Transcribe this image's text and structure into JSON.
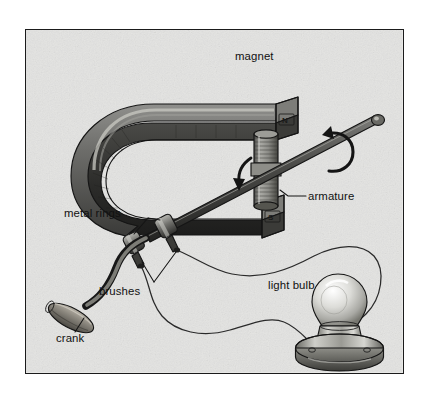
{
  "figure": {
    "frame": {
      "border_color": "#1b1b1b",
      "background_color": "#e8e8e6",
      "outer_background": "#ffffff"
    },
    "labels": [
      {
        "id": "magnet",
        "text": "magnet",
        "x": 234,
        "y": 55
      },
      {
        "id": "armature",
        "text": "armature",
        "x": 286,
        "y": 175
      },
      {
        "id": "metal-rings",
        "text": "metal rings",
        "x": 63,
        "y": 192
      },
      {
        "id": "brushes",
        "text": "brushes",
        "x": 98,
        "y": 261
      },
      {
        "id": "crank",
        "text": "crank",
        "x": 55,
        "y": 313
      },
      {
        "id": "light-bulb",
        "text": "light bulb",
        "x": 267,
        "y": 283
      }
    ],
    "pole_markings": [
      {
        "id": "north-pole",
        "text": "N"
      },
      {
        "id": "south-pole",
        "text": "S"
      }
    ],
    "parts": [
      "horseshoe-magnet",
      "armature-coil",
      "rotating-shaft",
      "shaft-knob",
      "slip-rings",
      "brushes",
      "crank-handle",
      "connecting-wires",
      "light-bulb",
      "bulb-socket-base",
      "rotation-arrows"
    ]
  }
}
